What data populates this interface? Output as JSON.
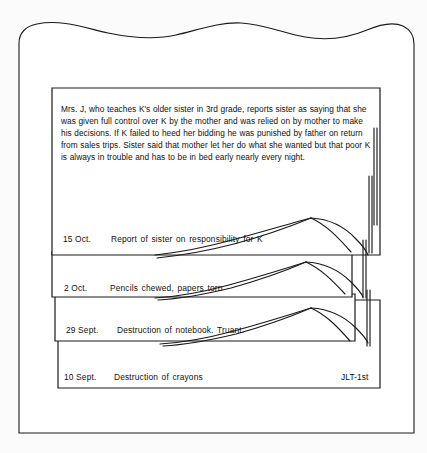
{
  "figure": {
    "kind": "anecdotal-record-card-file-illustration",
    "background_color": "#fbfbfb",
    "ink_color": "#1a1a1a"
  },
  "narrative": {
    "text": "Mrs. J, who teaches K's older sister in 3rd grade, reports sister as saying that she was given full control over K by the mother and was relied on by mother to make his decisions. If K failed to heed her bidding he was punished by father on return from sales trips. Sister said that mother let her do what she wanted but that poor K is always in trouble and has to be in bed early nearly every night."
  },
  "entries": [
    {
      "date": "15 Oct.",
      "description": "Report of sister on responsibility for K",
      "code": ""
    },
    {
      "date": "2 Oct.",
      "description": "Pencils chewed, papers torn",
      "code": ""
    },
    {
      "date": "29 Sept.",
      "description": "Destruction of notebook. Truant.",
      "code": ""
    },
    {
      "date": "10 Sept.",
      "description": "Destruction of crayons",
      "code": "JLT-1st"
    }
  ]
}
